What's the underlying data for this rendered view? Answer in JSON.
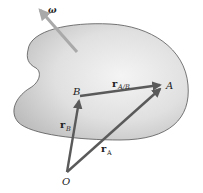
{
  "diagram": {
    "colors": {
      "body_fill_light": "#f2f2f2",
      "body_fill_dark": "#c9c9c9",
      "body_outline": "#555555",
      "vector": "#5a5a5a",
      "omega_arrow": "#a9a9a9",
      "text": "#222222"
    },
    "labels": {
      "omega": "ω",
      "point_A": "A",
      "point_B": "B",
      "point_O": "O",
      "vec_rAB_main": "r",
      "vec_rAB_sub": "A/B",
      "vec_rB_main": "r",
      "vec_rB_sub": "B",
      "vec_rA_main": "r",
      "vec_rA_sub": "A"
    },
    "points": {
      "O": [
        67,
        172
      ],
      "B": [
        80,
        96
      ],
      "A": [
        164,
        85
      ]
    },
    "vectors": [
      {
        "name": "r_B",
        "from": "O",
        "to": "B"
      },
      {
        "name": "r_A",
        "from": "O",
        "to": "A"
      },
      {
        "name": "r_A/B",
        "from": "B",
        "to": "A"
      }
    ],
    "angular_velocity_arrow": {
      "from": [
        77,
        52
      ],
      "to": [
        39,
        9
      ]
    }
  }
}
